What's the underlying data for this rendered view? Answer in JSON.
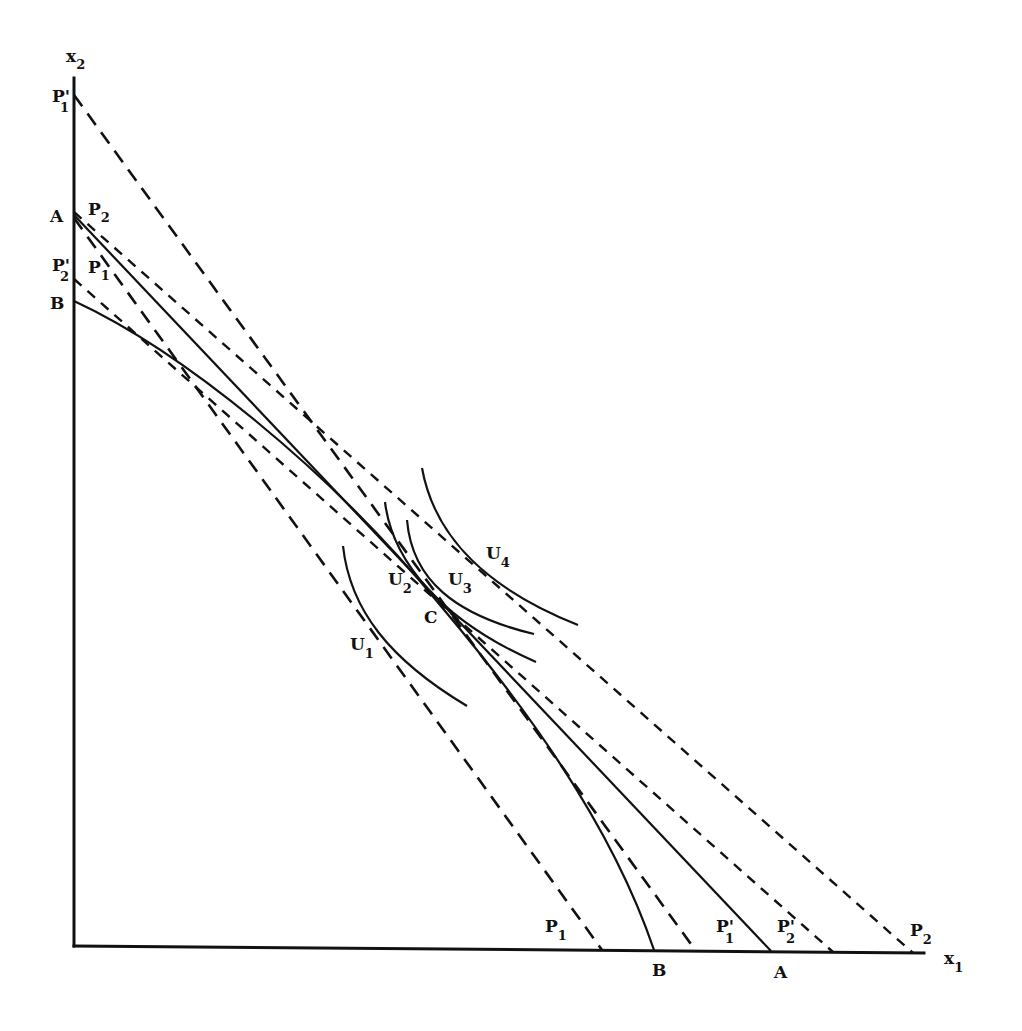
{
  "figure": {
    "axes": {
      "y_label": "x",
      "y_label_sub": "2",
      "x_label": "x",
      "x_label_sub": "1"
    },
    "y_axis_labels": [
      {
        "id": "P1prime",
        "text": "P",
        "sub": "1",
        "prime": "'"
      },
      {
        "id": "A",
        "text": "A"
      },
      {
        "id": "P2",
        "text": "P",
        "sub": "2"
      },
      {
        "id": "P2prime",
        "text": "P",
        "sub": "2",
        "prime": "'"
      },
      {
        "id": "P1",
        "text": "P",
        "sub": "1"
      },
      {
        "id": "B",
        "text": "B"
      }
    ],
    "x_axis_labels": [
      {
        "id": "P1",
        "text": "P",
        "sub": "1"
      },
      {
        "id": "B",
        "text": "B"
      },
      {
        "id": "P1prime",
        "text": "P",
        "sub": "1",
        "prime": "'"
      },
      {
        "id": "A",
        "text": "A"
      },
      {
        "id": "P2prime",
        "text": "P",
        "sub": "2",
        "prime": "'"
      },
      {
        "id": "P2",
        "text": "P",
        "sub": "2"
      }
    ],
    "curve_labels": [
      {
        "id": "U1",
        "text": "U",
        "sub": "1"
      },
      {
        "id": "U2",
        "text": "U",
        "sub": "2"
      },
      {
        "id": "U3",
        "text": "U",
        "sub": "3"
      },
      {
        "id": "U4",
        "text": "U",
        "sub": "4"
      }
    ],
    "point_labels": [
      {
        "id": "C",
        "text": "C"
      }
    ]
  }
}
